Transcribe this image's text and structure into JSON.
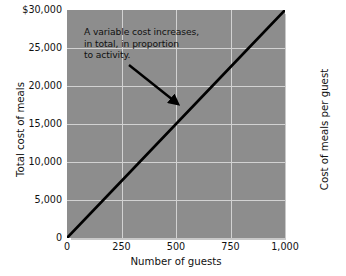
{
  "chart_data": {
    "type": "line",
    "title": "",
    "xlabel": "Number of guests",
    "ylabel": "Total cost of meals",
    "ylabel_right": "Cost of meals per guest",
    "xlim": [
      0,
      1000
    ],
    "ylim": [
      0,
      30000
    ],
    "grid": true,
    "legend": "none",
    "xticks": [
      0,
      250,
      500,
      750,
      1000
    ],
    "xtick_labels": [
      "0",
      "250",
      "500",
      "750",
      "1,000"
    ],
    "yticks": [
      0,
      5000,
      10000,
      15000,
      20000,
      25000,
      30000
    ],
    "ytick_labels": [
      "0",
      "5,000",
      "10,000",
      "15,000",
      "20,000",
      "25,000",
      "$30,000"
    ],
    "series": [
      {
        "name": "Total cost of meals",
        "x": [
          0,
          250,
          500,
          750,
          1000
        ],
        "values": [
          0,
          7500,
          15000,
          22500,
          30000
        ],
        "color": "#000000"
      }
    ],
    "annotations": [
      {
        "name": "variable-cost-note",
        "lines": [
          "A variable cost increases,",
          "in total, in proportion",
          "to activity."
        ],
        "arrow": {
          "from_x": 280,
          "from_y": 21500,
          "to_x": 510,
          "to_y": 15600
        }
      }
    ],
    "colors": {
      "plot_background": "#8d8d8d",
      "gridline": "#d2d2d2",
      "series_line": "#000000",
      "shadow": "#c9c9c9",
      "text": "#111111",
      "page_background": "#ffffff"
    }
  }
}
